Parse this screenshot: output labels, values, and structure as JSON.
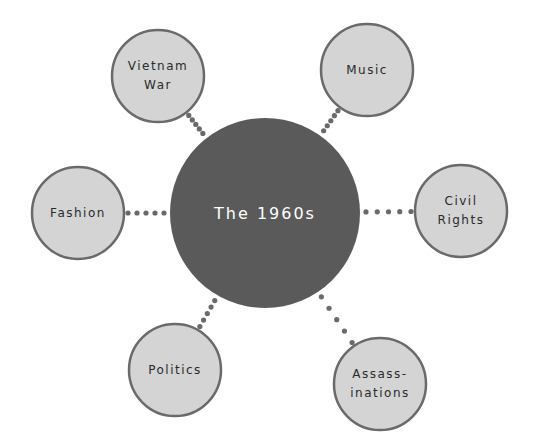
{
  "title": "The 1960s",
  "colors": {
    "center_fill": "#5a5a5a",
    "node_fill": "#d4d4d4",
    "node_stroke": "#6a6a6a",
    "dot": "#6a6a6a",
    "center_text": "#ffffff",
    "node_text": "#2a2a2a"
  },
  "center": {
    "label": "The 1960s",
    "cx": 265,
    "cy": 213,
    "r": 95
  },
  "nodes": [
    {
      "id": "vietnam-war",
      "lines": [
        "Vietnam",
        "War"
      ],
      "cx": 158,
      "cy": 76,
      "r": 46
    },
    {
      "id": "music",
      "lines": [
        "Music"
      ],
      "cx": 367,
      "cy": 70,
      "r": 46
    },
    {
      "id": "civil-rights",
      "lines": [
        "Civil",
        "Rights"
      ],
      "cx": 461,
      "cy": 211,
      "r": 46
    },
    {
      "id": "fashion",
      "lines": [
        "Fashion"
      ],
      "cx": 78,
      "cy": 213,
      "r": 46
    },
    {
      "id": "politics",
      "lines": [
        "Politics"
      ],
      "cx": 175,
      "cy": 370,
      "r": 46
    },
    {
      "id": "assassinations",
      "lines": [
        "Assass-",
        "inations"
      ],
      "cx": 380,
      "cy": 384,
      "r": 46
    }
  ]
}
